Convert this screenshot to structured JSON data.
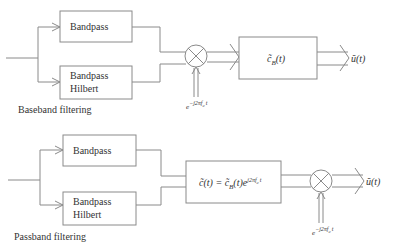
{
  "diagrams": [
    {
      "name": "baseband",
      "caption": "Baseband filtering",
      "blocks": {
        "bandpass": "Bandpass",
        "hilbert_line1": "Bandpass",
        "hilbert_line2": "Hilbert",
        "filter": "c̃",
        "filter_sub": "B",
        "filter_arg": "(t)"
      },
      "mixer_input": {
        "base": "e",
        "exp": "−j2πf",
        "exp_sub": "c",
        "exp_tail": "t"
      },
      "output": "ũ(t)"
    },
    {
      "name": "passband",
      "caption": "Passband filtering",
      "blocks": {
        "bandpass": "Bandpass",
        "hilbert_line1": "Bandpass",
        "hilbert_line2": "Hilbert",
        "filter_lhs": "c̃(t) = c̃",
        "filter_sub": "B",
        "filter_mid": "(t)e",
        "filter_exp": "j2πf",
        "filter_exp_sub": "c",
        "filter_exp_tail": "t"
      },
      "mixer_input": {
        "base": "e",
        "exp": "−j2πf",
        "exp_sub": "c",
        "exp_tail": "t"
      },
      "output": "ũ(t)"
    }
  ]
}
